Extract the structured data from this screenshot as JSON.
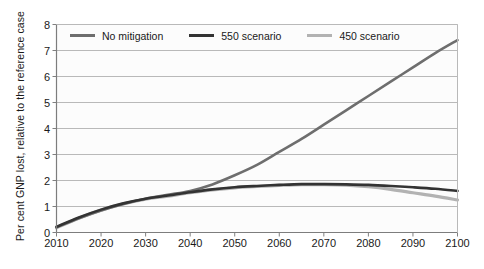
{
  "chart_data": {
    "type": "line",
    "title": "",
    "xlabel": "",
    "ylabel": "Per cent GNP lost, relative to the reference case",
    "xlim": [
      2010,
      2100
    ],
    "ylim": [
      0,
      8
    ],
    "xticks": [
      2010,
      2020,
      2030,
      2040,
      2050,
      2060,
      2070,
      2080,
      2090,
      2100
    ],
    "yticks": [
      0,
      1,
      2,
      3,
      4,
      5,
      6,
      7,
      8
    ],
    "grid": "horizontal",
    "legend_position": "top-inside",
    "x": [
      2010,
      2015,
      2020,
      2025,
      2030,
      2035,
      2040,
      2045,
      2050,
      2055,
      2060,
      2065,
      2070,
      2075,
      2080,
      2085,
      2090,
      2095,
      2100
    ],
    "series": [
      {
        "name": "No mitigation",
        "color": "#6e6e6e",
        "values": [
          0.2,
          0.55,
          0.85,
          1.1,
          1.3,
          1.45,
          1.6,
          1.85,
          2.2,
          2.6,
          3.1,
          3.6,
          4.15,
          4.7,
          5.25,
          5.8,
          6.35,
          6.9,
          7.4
        ]
      },
      {
        "name": "550 scenario",
        "color": "#333333",
        "values": [
          0.22,
          0.58,
          0.88,
          1.12,
          1.3,
          1.42,
          1.55,
          1.66,
          1.74,
          1.79,
          1.83,
          1.86,
          1.86,
          1.85,
          1.83,
          1.79,
          1.74,
          1.68,
          1.6
        ]
      },
      {
        "name": "450 scenario",
        "color": "#b2b2b2",
        "values": [
          0.18,
          0.55,
          0.86,
          1.1,
          1.28,
          1.4,
          1.53,
          1.64,
          1.72,
          1.77,
          1.81,
          1.84,
          1.84,
          1.82,
          1.76,
          1.66,
          1.53,
          1.4,
          1.25
        ]
      }
    ],
    "legend": [
      {
        "label": "No mitigation",
        "color": "#6e6e6e"
      },
      {
        "label": "550 scenario",
        "color": "#333333"
      },
      {
        "label": "450 scenario",
        "color": "#b2b2b2"
      }
    ],
    "ytick_labels": [
      "0",
      "1",
      "2",
      "3",
      "4",
      "5",
      "6",
      "7",
      "8"
    ],
    "xtick_labels": [
      "2010",
      "2020",
      "2030",
      "2040",
      "2050",
      "2060",
      "2070",
      "2080",
      "2090",
      "2100"
    ],
    "axis_color": "#808080",
    "grid_color": "#b9b9b9",
    "plot_background": "#fcfcfc"
  }
}
